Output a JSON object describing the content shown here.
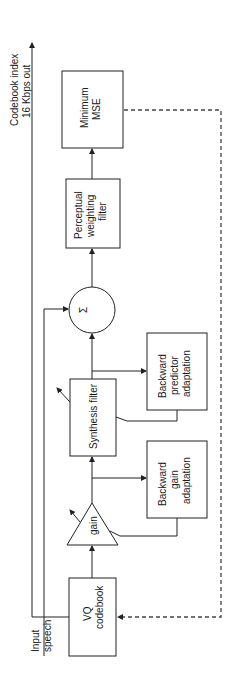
{
  "diagram": {
    "orientation": "rotated 90 degrees counter-clockwise",
    "output_label": [
      "Codebook index",
      "16 Kbps out"
    ],
    "input_label": [
      "Input",
      "speech"
    ],
    "blocks": {
      "vq_codebook": [
        "VQ",
        "codebook"
      ],
      "gain": "gain",
      "synthesis_filter": "Synthesis filter",
      "backward_gain": [
        "Backward",
        "gain",
        "adaptation"
      ],
      "backward_predictor": [
        "Backward",
        "predictor",
        "adaptation"
      ],
      "summer_symbol": "Σ",
      "perceptual_filter": [
        "Perceptual",
        "weighting",
        "filter"
      ],
      "minimum_mse": [
        "Minimum",
        "MSE"
      ]
    },
    "connections": [
      {
        "from": "vq_codebook",
        "to": "gain"
      },
      {
        "from": "gain",
        "to": "synthesis_filter"
      },
      {
        "from": "gain",
        "to": "backward_gain"
      },
      {
        "from": "backward_gain",
        "to": "gain",
        "kind": "adaptation"
      },
      {
        "from": "synthesis_filter",
        "to": "summer"
      },
      {
        "from": "synthesis_filter",
        "to": "backward_predictor"
      },
      {
        "from": "backward_predictor",
        "to": "synthesis_filter",
        "kind": "adaptation"
      },
      {
        "from": "input_speech",
        "to": "summer"
      },
      {
        "from": "summer",
        "to": "perceptual_filter"
      },
      {
        "from": "perceptual_filter",
        "to": "minimum_mse"
      },
      {
        "from": "minimum_mse",
        "to": "vq_codebook",
        "kind": "dashed feedback"
      },
      {
        "from": "vq_codebook",
        "to": "output",
        "kind": "codebook index out"
      }
    ],
    "colors": {
      "line": "#222222",
      "dashed": "#444444",
      "background": "#ffffff"
    }
  }
}
